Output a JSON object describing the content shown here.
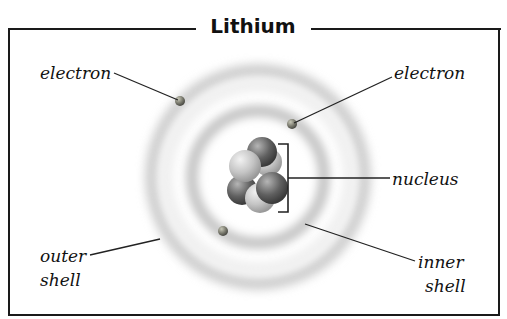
{
  "title": "Lithium",
  "labels": {
    "electron_left": "electron",
    "electron_right": "electron",
    "nucleus": "nucleus",
    "outer_shell_line1": "outer",
    "outer_shell_line2": "shell",
    "inner_shell_line1": "inner",
    "inner_shell_line2": "shell"
  },
  "atom": {
    "element": "Lithium",
    "electron_count": 3,
    "shells": [
      "inner shell",
      "outer shell"
    ]
  },
  "colors": {
    "frame": "#1a1a1a",
    "shell": "#c8c8c8",
    "electron": "#7a7a6e",
    "nucleus_dark": "#5c5c5c",
    "nucleus_light": "#d8d8d8"
  }
}
